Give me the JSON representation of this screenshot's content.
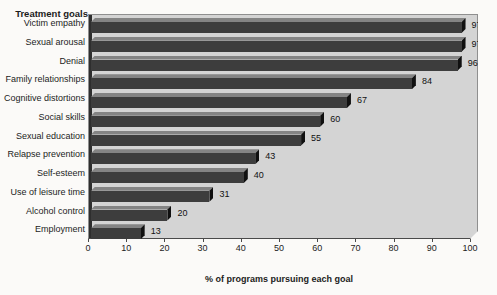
{
  "chart_data": {
    "type": "bar",
    "orientation": "horizontal",
    "y_axis_title": "Treatment goals",
    "xlabel": "% of programs pursuing each goal",
    "categories": [
      "Victim empathy",
      "Sexual arousal",
      "Denial",
      "Family relationships",
      "Cognitive distortions",
      "Social skills",
      "Sexual education",
      "Relapse prevention",
      "Self-esteem",
      "Use of leisure time",
      "Alcohol control",
      "Employment"
    ],
    "values": [
      97,
      97,
      96,
      84,
      67,
      60,
      55,
      43,
      40,
      31,
      20,
      13
    ],
    "xlim": [
      0,
      100
    ],
    "xticks": [
      0,
      10,
      20,
      30,
      40,
      50,
      60,
      70,
      80,
      90,
      100
    ],
    "grid": "off",
    "legend": "none",
    "data_labels": true,
    "colors": {
      "bar_front": "#3d3d3d",
      "bar_top": "#848484",
      "bar_end": "#101010",
      "plot_background": "#d4d4d4",
      "page_background": "#fbfaf8",
      "text": "#1c1c1c"
    }
  }
}
